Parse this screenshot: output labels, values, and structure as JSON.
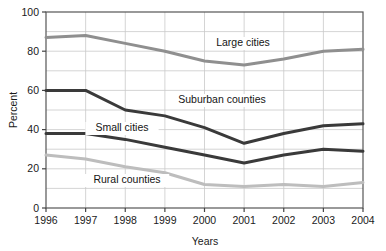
{
  "chart_data": {
    "type": "line",
    "title": "",
    "xlabel": "Years",
    "ylabel": "Percent",
    "categories": [
      "1996",
      "1997",
      "1998",
      "1999",
      "2000",
      "2001",
      "2002",
      "2003",
      "2004"
    ],
    "x": [
      1996,
      1997,
      1998,
      1999,
      2000,
      2001,
      2002,
      2003,
      2004
    ],
    "xlim": [
      1996,
      2004
    ],
    "ylim": [
      0,
      100
    ],
    "yticks": [
      0,
      20,
      40,
      60,
      80,
      100
    ],
    "yticklabels": [
      "0",
      "20",
      "40",
      "60",
      "80",
      "100"
    ],
    "gridline_step": 10,
    "grid": true,
    "legend_position": "inline-annotations",
    "series": [
      {
        "name": "Large cities",
        "color": "#8f8f8f",
        "values": [
          87,
          88,
          84,
          80,
          75,
          73,
          76,
          80,
          81
        ]
      },
      {
        "name": "Suburban counties",
        "color": "#3a3a3a",
        "values": [
          60,
          60,
          50,
          47,
          41,
          33,
          38,
          42,
          43
        ]
      },
      {
        "name": "Small cities",
        "color": "#3a3a3a",
        "values": [
          38,
          38,
          35,
          31,
          27,
          23,
          27,
          30,
          29
        ]
      },
      {
        "name": "Rural counties",
        "color": "#bdbdbd",
        "values": [
          27,
          25,
          21,
          18,
          12,
          11,
          12,
          11,
          13
        ]
      }
    ],
    "annotations": [
      {
        "text": "Large cities",
        "x_px": 243,
        "y_px": 46
      },
      {
        "text": "Suburban counties",
        "x_px": 222,
        "y_px": 103
      },
      {
        "text": "Small cities",
        "x_px": 122,
        "y_px": 131
      },
      {
        "text": "Rural counties",
        "x_px": 127,
        "y_px": 183
      }
    ]
  },
  "axes": {
    "y_title": "Percent",
    "x_title": "Years"
  }
}
